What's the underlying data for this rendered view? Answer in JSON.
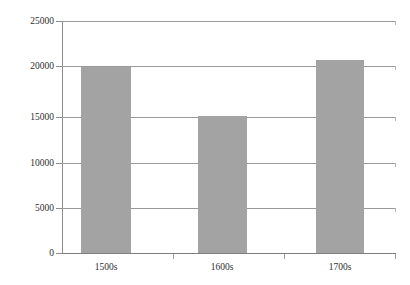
{
  "chart_data": {
    "type": "bar",
    "title": "",
    "subtitle": "",
    "xlabel": "",
    "ylabel": "",
    "categories": [
      "1500s",
      "1600s",
      "1700s"
    ],
    "values": [
      20000,
      14800,
      20800
    ],
    "series": [
      {
        "name": "",
        "values": [
          20000,
          14800,
          20800
        ]
      }
    ],
    "ylim": [
      0,
      25000
    ],
    "ytick_labels": [
      "25000",
      "20000",
      "15000",
      "10000",
      "5000",
      "0"
    ],
    "ytick_values": [
      25000,
      20000,
      15000,
      10000,
      5000,
      0
    ],
    "grid": true,
    "grid_axis": "y",
    "legend": false,
    "legend_position": "none",
    "bar_color": "#a3a3a3",
    "gridline_color": "#9a9a9a",
    "axis_color": "#8c8c8c",
    "background_color": "#ffffff",
    "text_color": "#2e2e2e"
  }
}
